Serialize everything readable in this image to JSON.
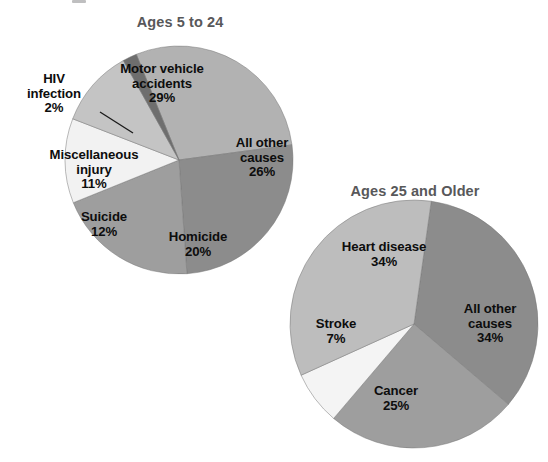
{
  "figure": {
    "background": "#ffffff",
    "label_color": "#0d0d0d",
    "title_color": "#58585a"
  },
  "chart_data": [
    {
      "type": "pie",
      "title": "Ages 5 to 24",
      "labels": [
        "Motor vehicle accidents",
        "All other causes",
        "Homicide",
        "Suicide",
        "Miscellaneous injury",
        "HIV infection"
      ],
      "values": [
        29,
        26,
        20,
        12,
        11,
        2
      ],
      "value_labels": [
        "29%",
        "26%",
        "20%",
        "12%",
        "11%",
        "2%"
      ],
      "colors": [
        "#b2b2b2",
        "#8c8c8c",
        "#9e9e9e",
        "#f2f2f2",
        "#c4c4c4",
        "#6e6e6e"
      ],
      "units": "percent",
      "start_angle_deg": -22,
      "direction": "clockwise",
      "legend": "none",
      "annotations": [
        "HIV infection 2% slice is labeled outside the pie with a leader line"
      ]
    },
    {
      "type": "pie",
      "title": "Ages 25 and Older",
      "labels": [
        "All other causes",
        "Cancer",
        "Stroke",
        "Heart disease"
      ],
      "values": [
        34,
        25,
        7,
        34
      ],
      "value_labels": [
        "34%",
        "25%",
        "7%",
        "34%"
      ],
      "colors": [
        "#8c8c8c",
        "#9e9e9e",
        "#f4f4f4",
        "#bdbdbd"
      ],
      "units": "percent",
      "start_angle_deg": 8,
      "direction": "clockwise",
      "legend": "none"
    }
  ],
  "pie1": {
    "title": "Ages 5 to 24",
    "slices": [
      {
        "name": "Motor vehicle accidents",
        "name_line1": "Motor vehicle",
        "name_line2": "accidents",
        "pct": "29%"
      },
      {
        "name": "All other causes",
        "name_line1": "All other",
        "name_line2": "causes",
        "pct": "26%"
      },
      {
        "name": "Homicide",
        "name_line1": "Homicide",
        "name_line2": "",
        "pct": "20%"
      },
      {
        "name": "Suicide",
        "name_line1": "Suicide",
        "name_line2": "",
        "pct": "12%"
      },
      {
        "name": "Miscellaneous injury",
        "name_line1": "Miscellaneous",
        "name_line2": "injury",
        "pct": "11%"
      },
      {
        "name": "HIV infection",
        "name_line1": "HIV",
        "name_line2": "infection",
        "pct": "2%"
      }
    ]
  },
  "pie2": {
    "title": "Ages 25 and Older",
    "slices": [
      {
        "name": "Heart disease",
        "name_line1": "Heart disease",
        "name_line2": "",
        "pct": "34%"
      },
      {
        "name": "All other causes",
        "name_line1": "All other",
        "name_line2": "causes",
        "pct": "34%"
      },
      {
        "name": "Cancer",
        "name_line1": "Cancer",
        "name_line2": "",
        "pct": "25%"
      },
      {
        "name": "Stroke",
        "name_line1": "Stroke",
        "name_line2": "",
        "pct": "7%"
      }
    ]
  }
}
